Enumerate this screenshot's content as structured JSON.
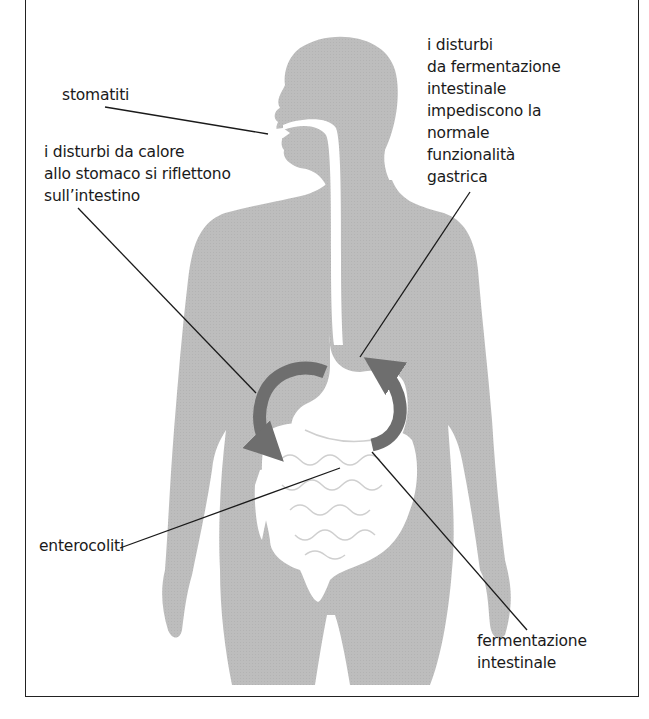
{
  "diagram": {
    "type": "anatomical-illustration",
    "colors": {
      "silhouette": "#bdbdbd",
      "organs": "#ffffff",
      "arrows": "#6e6e6e",
      "leader_lines": "#1a1a1a",
      "frame": "#222222"
    },
    "labels": {
      "stomatiti": "stomatiti",
      "heat_disorders": "i disturbi da calore\nallo stomaco si riflettono\nsull’intestino",
      "fermentation_disorders": "i disturbi\nda fermentazione\nintestinale\nimpediscono la\nnormale\nfunzionalità\ngastrica",
      "enterocoliti": "enterocoliti",
      "fermentazione": "fermentazione\nintestinale"
    },
    "arrows": [
      {
        "name": "stomach-to-intestine-arrow",
        "direction": "counter-clockwise down-left"
      },
      {
        "name": "intestine-to-stomach-arrow",
        "direction": "up toward stomach"
      }
    ]
  }
}
